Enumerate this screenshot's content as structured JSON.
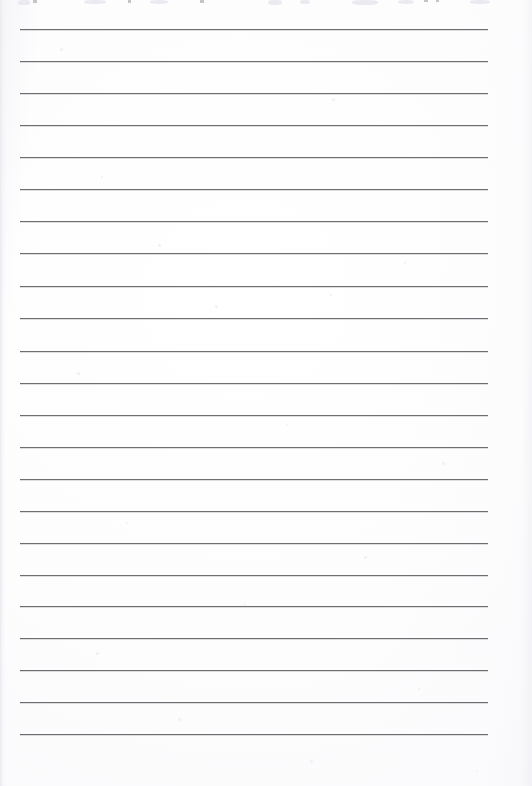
{
  "document": {
    "kind": "scanned-lined-writing-paper",
    "title": "Blank Lined Answer Sheet",
    "page_width": 532,
    "page_height": 786,
    "background_color": "#fdfdfd",
    "rule_color": "#6e6e72",
    "rule_thickness": 1,
    "rule_left": 20,
    "rule_right": 488,
    "rule_count": 23,
    "first_rule_y": 29,
    "rule_spacing": 32,
    "bottom_margin": 52,
    "body_text": "",
    "has_written_content": false
  },
  "ruled_lines": [
    {
      "index": 1,
      "y": 29,
      "x1": 20,
      "x2": 488,
      "text": ""
    },
    {
      "index": 2,
      "y": 61,
      "x1": 20,
      "x2": 488,
      "text": ""
    },
    {
      "index": 3,
      "y": 93,
      "x1": 20,
      "x2": 488,
      "text": ""
    },
    {
      "index": 4,
      "y": 125,
      "x1": 20,
      "x2": 488,
      "text": ""
    },
    {
      "index": 5,
      "y": 157,
      "x1": 20,
      "x2": 488,
      "text": ""
    },
    {
      "index": 6,
      "y": 189,
      "x1": 20,
      "x2": 488,
      "text": ""
    },
    {
      "index": 7,
      "y": 221,
      "x1": 20,
      "x2": 488,
      "text": ""
    },
    {
      "index": 8,
      "y": 253,
      "x1": 20,
      "x2": 488,
      "text": ""
    },
    {
      "index": 9,
      "y": 286,
      "x1": 20,
      "x2": 488,
      "text": ""
    },
    {
      "index": 10,
      "y": 318,
      "x1": 20,
      "x2": 488,
      "text": ""
    },
    {
      "index": 11,
      "y": 351,
      "x1": 20,
      "x2": 488,
      "text": ""
    },
    {
      "index": 12,
      "y": 383,
      "x1": 20,
      "x2": 488,
      "text": ""
    },
    {
      "index": 13,
      "y": 415,
      "x1": 20,
      "x2": 488,
      "text": ""
    },
    {
      "index": 14,
      "y": 447,
      "x1": 20,
      "x2": 488,
      "text": ""
    },
    {
      "index": 15,
      "y": 479,
      "x1": 20,
      "x2": 488,
      "text": ""
    },
    {
      "index": 16,
      "y": 511,
      "x1": 20,
      "x2": 488,
      "text": ""
    },
    {
      "index": 17,
      "y": 543,
      "x1": 20,
      "x2": 488,
      "text": ""
    },
    {
      "index": 18,
      "y": 575,
      "x1": 20,
      "x2": 488,
      "text": ""
    },
    {
      "index": 19,
      "y": 606,
      "x1": 20,
      "x2": 488,
      "text": ""
    },
    {
      "index": 20,
      "y": 638,
      "x1": 20,
      "x2": 488,
      "text": ""
    },
    {
      "index": 21,
      "y": 670,
      "x1": 20,
      "x2": 488,
      "text": ""
    },
    {
      "index": 22,
      "y": 702,
      "x1": 20,
      "x2": 488,
      "text": ""
    },
    {
      "index": 23,
      "y": 734,
      "x1": 20,
      "x2": 488,
      "text": ""
    }
  ],
  "clipped_header": {
    "description": "row of text cropped off at the top edge of the scan; only faint ink remnants remain",
    "legible_text": "",
    "marks": [
      {
        "x": 33,
        "width": 4,
        "height": 3
      },
      {
        "x": 128,
        "width": 3,
        "height": 3
      },
      {
        "x": 200,
        "width": 4,
        "height": 3
      },
      {
        "x": 424,
        "width": 4,
        "height": 2
      },
      {
        "x": 436,
        "width": 3,
        "height": 2
      }
    ],
    "smudges": [
      {
        "x": 18,
        "width": 12,
        "height": 5
      },
      {
        "x": 84,
        "width": 22,
        "height": 4
      },
      {
        "x": 150,
        "width": 18,
        "height": 4
      },
      {
        "x": 268,
        "width": 14,
        "height": 5
      },
      {
        "x": 300,
        "width": 10,
        "height": 4
      },
      {
        "x": 352,
        "width": 26,
        "height": 5
      },
      {
        "x": 398,
        "width": 16,
        "height": 4
      },
      {
        "x": 470,
        "width": 20,
        "height": 4
      }
    ]
  },
  "scan_artifacts": {
    "speckles": [
      {
        "x": 60,
        "y": 48,
        "size": 3
      },
      {
        "x": 332,
        "y": 98,
        "size": 3
      },
      {
        "x": 101,
        "y": 176,
        "size": 2
      },
      {
        "x": 158,
        "y": 244,
        "size": 3
      },
      {
        "x": 404,
        "y": 262,
        "size": 2
      },
      {
        "x": 215,
        "y": 305,
        "size": 3
      },
      {
        "x": 330,
        "y": 294,
        "size": 2
      },
      {
        "x": 77,
        "y": 372,
        "size": 3
      },
      {
        "x": 286,
        "y": 424,
        "size": 2
      },
      {
        "x": 442,
        "y": 462,
        "size": 3
      },
      {
        "x": 126,
        "y": 522,
        "size": 2
      },
      {
        "x": 364,
        "y": 556,
        "size": 3
      },
      {
        "x": 244,
        "y": 604,
        "size": 2
      },
      {
        "x": 96,
        "y": 652,
        "size": 3
      },
      {
        "x": 418,
        "y": 688,
        "size": 2
      },
      {
        "x": 178,
        "y": 718,
        "size": 3
      },
      {
        "x": 310,
        "y": 760,
        "size": 3
      },
      {
        "x": 476,
        "y": 770,
        "size": 2
      }
    ]
  }
}
